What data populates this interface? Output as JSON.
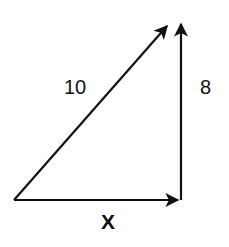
{
  "diagram": {
    "type": "vector-right-triangle",
    "colors": {
      "stroke": "#111111",
      "background": "#ffffff"
    },
    "vectors": [
      {
        "name": "hypotenuse",
        "label": "10",
        "from": [
          14,
          200
        ],
        "to": [
          167,
          26
        ]
      },
      {
        "name": "vertical",
        "label": "8",
        "from": [
          181,
          199
        ],
        "to": [
          181,
          24
        ]
      },
      {
        "name": "horizontal",
        "label": "X",
        "from": [
          14,
          200
        ],
        "to": [
          178,
          200
        ]
      }
    ],
    "labels": {
      "hypotenuse": "10",
      "vertical": "8",
      "horizontal": "X"
    }
  }
}
